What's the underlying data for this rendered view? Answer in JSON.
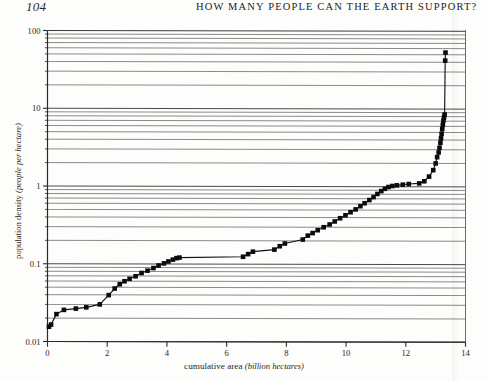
{
  "page": {
    "folio": "104",
    "running_head": "HOW MANY PEOPLE CAN THE EARTH SUPPORT?"
  },
  "chart_data": {
    "type": "scatter",
    "title": "",
    "xlabel_main": "cumulative area",
    "xlabel_units": "(billion hectares)",
    "ylabel_main": "population density",
    "ylabel_units": "(people per hectare)",
    "xscale": "linear",
    "yscale": "log",
    "xlim": [
      0,
      14
    ],
    "ylim": [
      0.01,
      100
    ],
    "xticks": [
      0,
      2,
      4,
      6,
      8,
      10,
      12,
      14
    ],
    "xtick_labels": [
      "0",
      "2",
      "4",
      "6",
      "8",
      "10",
      "12",
      "14"
    ],
    "yticks": [
      0.01,
      0.1,
      1,
      10,
      100
    ],
    "ytick_labels": [
      "0.01",
      "0.1",
      "1",
      "10",
      "100"
    ],
    "grid": "horizontal-log-minor",
    "legend": "none",
    "marker": "filled-square",
    "connected": true,
    "series": [
      {
        "name": "countries ranked by population density",
        "points": [
          [
            0.05,
            0.0155
          ],
          [
            0.12,
            0.0165
          ],
          [
            0.3,
            0.0225
          ],
          [
            0.55,
            0.0255
          ],
          [
            0.95,
            0.0265
          ],
          [
            1.3,
            0.0275
          ],
          [
            1.75,
            0.03
          ],
          [
            2.05,
            0.0395
          ],
          [
            2.25,
            0.048
          ],
          [
            2.42,
            0.0545
          ],
          [
            2.58,
            0.0595
          ],
          [
            2.75,
            0.064
          ],
          [
            2.95,
            0.069
          ],
          [
            3.15,
            0.076
          ],
          [
            3.35,
            0.0815
          ],
          [
            3.55,
            0.088
          ],
          [
            3.72,
            0.095
          ],
          [
            3.9,
            0.101
          ],
          [
            4.05,
            0.107
          ],
          [
            4.2,
            0.113
          ],
          [
            4.32,
            0.118
          ],
          [
            4.42,
            0.12
          ],
          [
            6.55,
            0.123
          ],
          [
            6.72,
            0.133
          ],
          [
            6.88,
            0.143
          ],
          [
            7.6,
            0.152
          ],
          [
            7.78,
            0.168
          ],
          [
            7.95,
            0.182
          ],
          [
            8.55,
            0.205
          ],
          [
            8.72,
            0.23
          ],
          [
            8.88,
            0.248
          ],
          [
            9.05,
            0.27
          ],
          [
            9.25,
            0.295
          ],
          [
            9.45,
            0.32
          ],
          [
            9.62,
            0.35
          ],
          [
            9.8,
            0.385
          ],
          [
            9.98,
            0.42
          ],
          [
            10.15,
            0.46
          ],
          [
            10.32,
            0.5
          ],
          [
            10.48,
            0.55
          ],
          [
            10.62,
            0.6
          ],
          [
            10.78,
            0.66
          ],
          [
            10.92,
            0.72
          ],
          [
            11.05,
            0.79
          ],
          [
            11.18,
            0.86
          ],
          [
            11.3,
            0.92
          ],
          [
            11.42,
            0.97
          ],
          [
            11.55,
            1.0
          ],
          [
            11.7,
            1.02
          ],
          [
            11.9,
            1.04
          ],
          [
            12.1,
            1.06
          ],
          [
            12.45,
            1.08
          ],
          [
            12.62,
            1.15
          ],
          [
            12.78,
            1.32
          ],
          [
            12.92,
            1.6
          ],
          [
            13.0,
            1.95
          ],
          [
            13.05,
            2.35
          ],
          [
            13.1,
            2.7
          ],
          [
            13.13,
            3.1
          ],
          [
            13.16,
            3.6
          ],
          [
            13.18,
            4.1
          ],
          [
            13.2,
            4.7
          ],
          [
            13.22,
            5.4
          ],
          [
            13.24,
            6.1
          ],
          [
            13.26,
            6.9
          ],
          [
            13.28,
            7.6
          ],
          [
            13.3,
            8.3
          ],
          [
            13.32,
            41.0
          ],
          [
            13.33,
            52.0
          ]
        ]
      }
    ],
    "annotations": []
  }
}
